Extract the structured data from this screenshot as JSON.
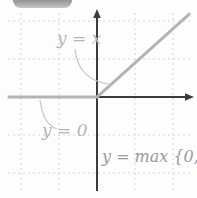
{
  "figure": {
    "labels": {
      "y_equals_x": "y = x",
      "y_equals_zero": "y = 0",
      "y_equals_max": "y = max {0, x}"
    },
    "colors": {
      "background": "#fdfdfd",
      "axis": "#3c3c3c",
      "function_line": "#b3b3b3",
      "grid": "#d9d5cc",
      "label_light": "#b5b5b5",
      "label_dark": "#9a9a9a",
      "pill_gradient_top": "#6f6f6f",
      "pill_gradient_bottom": "#c6c6c6"
    }
  },
  "chart_data": {
    "type": "line",
    "title": "y = max {0, x}",
    "xlabel": "",
    "ylabel": "",
    "xlim": [
      -2.4,
      2.6
    ],
    "ylim": [
      -2.6,
      2.3
    ],
    "x_ticks": [
      -2,
      -1,
      1,
      2
    ],
    "y_ticks": [
      -2,
      -1,
      1,
      2
    ],
    "grid": "dashed",
    "axes_style": "centered-at-origin-with-arrows",
    "series": [
      {
        "name": "y = max {0, x}",
        "points": [
          [
            -2.35,
            0
          ],
          [
            0,
            0
          ],
          [
            2.45,
            2.2
          ]
        ],
        "color": "#b3b3b3"
      }
    ],
    "annotations": [
      {
        "text": "y = x",
        "refers_to": "diagonal segment for x >= 0"
      },
      {
        "text": "y = 0",
        "refers_to": "horizontal segment for x <= 0"
      },
      {
        "text": "y = max {0, x}",
        "refers_to": "plotted function"
      }
    ]
  }
}
